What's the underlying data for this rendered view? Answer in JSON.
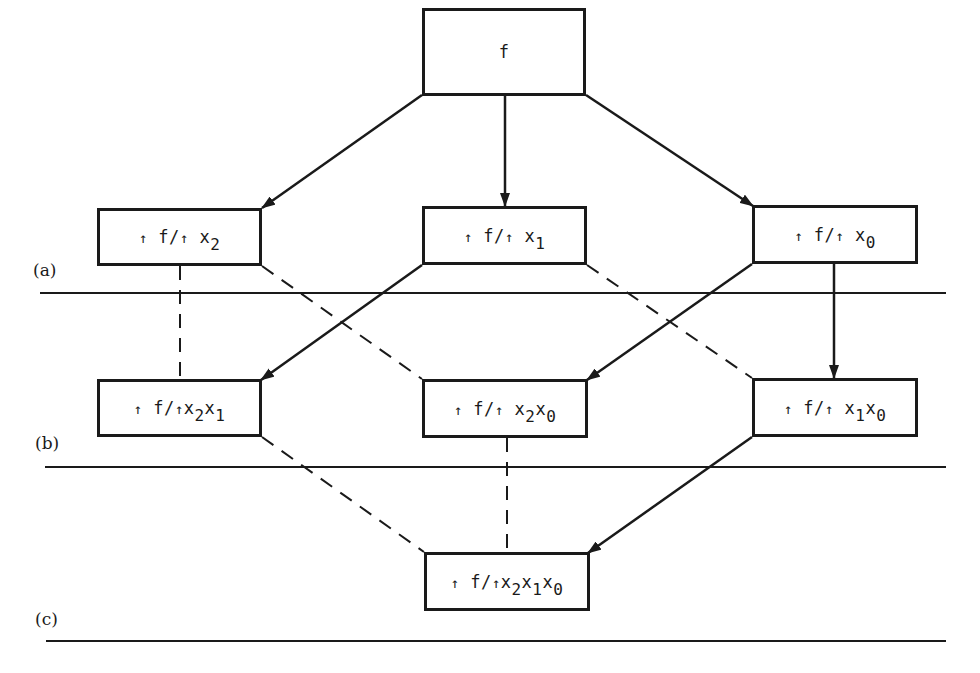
{
  "diagram": {
    "type": "lattice-of-partial-derivatives",
    "nodes": [
      {
        "id": "f",
        "label": "f",
        "parts": [
          {
            "t": "f"
          }
        ],
        "x": 422,
        "y": 8,
        "w": 164,
        "h": 88
      },
      {
        "id": "df_dx2",
        "label": "↑f/↑x2",
        "parts": [
          {
            "a": "↑"
          },
          {
            "t": " f/"
          },
          {
            "a": "↑"
          },
          {
            "t": " x"
          },
          {
            "s": "2"
          }
        ],
        "x": 97,
        "y": 208,
        "w": 165,
        "h": 58
      },
      {
        "id": "df_dx1",
        "label": "↑f/↑x1",
        "parts": [
          {
            "a": "↑"
          },
          {
            "t": " f/"
          },
          {
            "a": "↑"
          },
          {
            "t": " x"
          },
          {
            "s": "1"
          }
        ],
        "x": 422,
        "y": 206,
        "w": 165,
        "h": 59
      },
      {
        "id": "df_dx0",
        "label": "↑f/↑x0",
        "parts": [
          {
            "a": "↑"
          },
          {
            "t": " f/"
          },
          {
            "a": "↑"
          },
          {
            "t": " x"
          },
          {
            "s": "0"
          }
        ],
        "x": 752,
        "y": 205,
        "w": 166,
        "h": 59
      },
      {
        "id": "df_dx2x1",
        "label": "↑f/↑x2x1",
        "parts": [
          {
            "a": "↑"
          },
          {
            "t": " f/"
          },
          {
            "a": "↑"
          },
          {
            "t": "x"
          },
          {
            "s": "2"
          },
          {
            "t": "x"
          },
          {
            "s": "1"
          }
        ],
        "x": 97,
        "y": 379,
        "w": 165,
        "h": 58
      },
      {
        "id": "df_dx2x0",
        "label": "↑f/↑x2x0",
        "parts": [
          {
            "a": "↑"
          },
          {
            "t": " f/"
          },
          {
            "a": "↑"
          },
          {
            "t": " x"
          },
          {
            "s": "2"
          },
          {
            "t": "x"
          },
          {
            "s": "0"
          }
        ],
        "x": 422,
        "y": 379,
        "w": 166,
        "h": 59
      },
      {
        "id": "df_dx1x0",
        "label": "↑f/↑x1x0",
        "parts": [
          {
            "a": "↑"
          },
          {
            "t": " f/"
          },
          {
            "a": "↑"
          },
          {
            "t": " x"
          },
          {
            "s": "1"
          },
          {
            "t": "x"
          },
          {
            "s": "0"
          }
        ],
        "x": 752,
        "y": 378,
        "w": 166,
        "h": 59
      },
      {
        "id": "df_dx2x1x0",
        "label": "↑f/↑x2x1x0",
        "parts": [
          {
            "a": "↑"
          },
          {
            "t": " f/"
          },
          {
            "a": "↑"
          },
          {
            "t": "x"
          },
          {
            "s": "2"
          },
          {
            "t": "x"
          },
          {
            "s": "1"
          },
          {
            "t": "x"
          },
          {
            "s": "0"
          }
        ],
        "x": 424,
        "y": 552,
        "w": 166,
        "h": 59
      }
    ],
    "solid_arrows": [
      {
        "from": "f",
        "to": "df_dx2",
        "x1": 422,
        "y1": 95,
        "x2": 262,
        "y2": 208
      },
      {
        "from": "f",
        "to": "df_dx1",
        "x1": 505,
        "y1": 95,
        "x2": 505,
        "y2": 206
      },
      {
        "from": "f",
        "to": "df_dx0",
        "x1": 586,
        "y1": 95,
        "x2": 753,
        "y2": 206
      },
      {
        "from": "df_dx1",
        "to": "df_dx2x1",
        "x1": 422,
        "y1": 265,
        "x2": 261,
        "y2": 380
      },
      {
        "from": "df_dx0",
        "to": "df_dx2x0",
        "x1": 752,
        "y1": 264,
        "x2": 587,
        "y2": 380
      },
      {
        "from": "df_dx0",
        "to": "df_dx1x0",
        "x1": 834,
        "y1": 264,
        "x2": 834,
        "y2": 378
      },
      {
        "from": "df_dx1x0",
        "to": "df_dx2x1x0",
        "x1": 752,
        "y1": 437,
        "x2": 588,
        "y2": 553
      }
    ],
    "dashed_links": [
      {
        "from": "df_dx2",
        "to": "df_dx2x1",
        "x1": 180,
        "y1": 266,
        "x2": 180,
        "y2": 379
      },
      {
        "from": "df_dx2",
        "to": "df_dx2x0",
        "x1": 262,
        "y1": 266,
        "x2": 422,
        "y2": 379
      },
      {
        "from": "df_dx1",
        "to": "df_dx1x0",
        "x1": 587,
        "y1": 265,
        "x2": 752,
        "y2": 378
      },
      {
        "from": "df_dx2x1",
        "to": "df_dx2x1x0",
        "x1": 262,
        "y1": 437,
        "x2": 424,
        "y2": 552
      },
      {
        "from": "df_dx2x0",
        "to": "df_dx2x1x0",
        "x1": 507,
        "y1": 438,
        "x2": 507,
        "y2": 552
      }
    ],
    "levels": [
      {
        "label": "(a)",
        "label_x": 33,
        "label_y": 260,
        "line_x1": 40,
        "line_x2": 946,
        "line_y": 293
      },
      {
        "label": "(b)",
        "label_x": 35,
        "label_y": 433,
        "line_x1": 45,
        "line_x2": 946,
        "line_y": 467
      },
      {
        "label": "(c)",
        "label_x": 35,
        "label_y": 609,
        "line_x1": 46,
        "line_x2": 946,
        "line_y": 641
      }
    ],
    "colors": {
      "ink": "#1a1a1a",
      "background": "#ffffff"
    }
  }
}
